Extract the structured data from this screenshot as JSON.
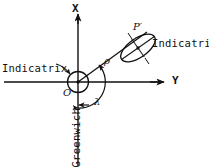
{
  "figure": {
    "background_color": "#ffffff",
    "line_color": "#111111",
    "width": 209,
    "height": 167
  },
  "axes": {
    "vertical_label": "X",
    "horizontal_label": "Y",
    "origin_label": "O",
    "origin": {
      "x": 78,
      "y": 82
    },
    "vertical_top": {
      "x": 78,
      "y": 13
    },
    "vertical_bottom": {
      "x": 78,
      "y": 166
    },
    "horizontal_left": {
      "x": 4,
      "y": 82
    },
    "horizontal_right": {
      "x": 164,
      "y": 82
    }
  },
  "labels": {
    "point_p_prime": "P′",
    "radius_rho": "ρ",
    "angle_lambda": "λ",
    "indicatrix_left": "Indicatrix",
    "indicatrix_right": "Indicatrix",
    "greenwich": "Greenwich"
  },
  "shapes": {
    "origin_indicatrix": {
      "name": "circle",
      "center": {
        "x": 78,
        "y": 82
      },
      "radius": 10.5
    },
    "point_indicatrix": {
      "name": "ellipse",
      "center": {
        "x": 138,
        "y": 48
      },
      "semi_major": 20,
      "semi_minor": 10,
      "rotation_deg": -30
    },
    "radius_line": {
      "from": {
        "x": 78,
        "y": 82
      },
      "to": {
        "x": 146,
        "y": 33
      }
    },
    "angle_arc": {
      "center": {
        "x": 78,
        "y": 82
      },
      "radius": 26,
      "start_deg": 90,
      "end_deg": -36,
      "note": "measured from Greenwich meridian (downward X-negative axis) to radius line"
    },
    "leader_indicatrix_left": {
      "from": {
        "x": 58,
        "y": 64
      },
      "to": {
        "x": 70,
        "y": 74
      }
    },
    "greenwich_tick": {
      "from": {
        "x": 88,
        "y": 105
      },
      "to": {
        "x": 79,
        "y": 105
      }
    }
  }
}
